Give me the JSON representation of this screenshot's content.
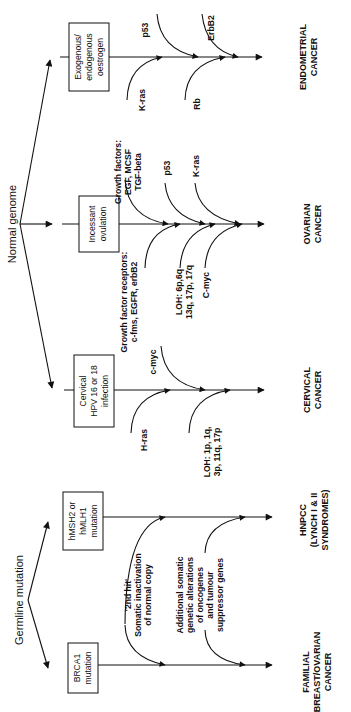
{
  "diagram": {
    "orientation": "rotated-90-ccw",
    "roots": {
      "normal_genome": "Normal genome",
      "germline_mutation": "Germline mutation"
    },
    "pathways": [
      {
        "id": "endometrial",
        "trigger": [
          "Exogenous/",
          "endogenous",
          "oestrogen"
        ],
        "upper_hits": [
          "p53",
          "ErbB2"
        ],
        "lower_hits": [
          "K-ras",
          "Rb"
        ],
        "outcome": [
          "ENDOMETRIAL",
          "CANCER"
        ]
      },
      {
        "id": "ovarian",
        "trigger": [
          "Incessant",
          "ovulation"
        ],
        "upper_hits": [
          [
            "Growth factors:",
            "EGF, MCSF",
            "TGF-beta"
          ],
          [
            "p53"
          ],
          [
            "K-ras"
          ]
        ],
        "lower_hits": [
          [
            "Growth factor receptors:",
            "c-fms, EGFR, erbB2"
          ],
          [
            "LOH: 6p,6q",
            "13q, 17p, 17q"
          ],
          [
            "C-myc"
          ]
        ],
        "outcome": [
          "OVARIAN",
          "CANCER"
        ]
      },
      {
        "id": "cervical",
        "trigger": [
          "Cervical",
          "HPV 16 or 18",
          "infection"
        ],
        "upper_hits": [
          "c-myc"
        ],
        "lower_hits": [
          [
            "H-ras"
          ],
          [
            "LOH: 1p, 1q,",
            "3p, 11q, 17p"
          ]
        ],
        "outcome": [
          "CERVICAL",
          "CANCER"
        ]
      },
      {
        "id": "hnpcc",
        "trigger": [
          "hMSH2 or",
          "hMLH1",
          "mutation"
        ],
        "outcome": [
          "HNPCC",
          "(LYNCH I & II",
          "SYNDROMES)"
        ]
      },
      {
        "id": "brca",
        "trigger": [
          "BRCA1",
          "mutation"
        ],
        "outcome": [
          "FAMILIAL",
          "BREAST/OVARIAN",
          "CANCER"
        ]
      }
    ],
    "shared_hits": {
      "second_hit": [
        "'2nd hit'",
        "Somatic inactivation",
        "of normal copy"
      ],
      "additional": [
        "Additional somatic",
        "genetic alterations",
        "of oncogenes",
        "and tumour",
        "suppressor genes"
      ]
    }
  }
}
